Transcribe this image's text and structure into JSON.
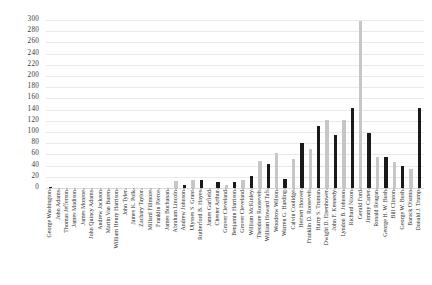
{
  "chart_data": {
    "type": "bar",
    "title": "",
    "xlabel": "",
    "ylabel": "",
    "ylim": [
      0,
      300
    ],
    "ytick_step": 20,
    "grid": true,
    "legend": "none",
    "colors": {
      "dark": "#1a1a1a",
      "light": "#c6c6c6"
    },
    "yticks": [
      "300",
      "280",
      "260",
      "240",
      "220",
      "200",
      "180",
      "160",
      "140",
      "120",
      "100",
      "80",
      "60",
      "40",
      "20",
      "0"
    ],
    "categories": [
      "George Washington",
      "John Adams",
      "Thomas Jefferson",
      "James Madison",
      "James Monroe",
      "John Quincy Adams",
      "Andrew Jackson",
      "Martin Van Buren",
      "William Henry Harrison",
      "John Tyler",
      "James K. Polk",
      "Zachary Taylor",
      "Millard Fillmore",
      "Franklin Pierce",
      "James Buchanan",
      "Abraham Lincoln",
      "Andrew Johnson",
      "Ulysses S. Grant",
      "Rutherford B. Hayes",
      "James Garfield",
      "Chester Arthur",
      "Grover Cleveland",
      "Benjamin Harrison",
      "Grover Cleveland",
      "William McKinley",
      "Theodore Roosevelt",
      "William Howard Taft",
      "Woodrow Wilson",
      "Warren G. Harding",
      "Calvin Coolidge",
      "Herbert Hoover",
      "Franklin D. Roosevelt",
      "Harry S. Truman",
      "Dwight D. Eisenhower",
      "John F. Kennedy",
      "Lyndon B. Johnson",
      "Richard Nixon",
      "Gerald Ford",
      "Jimmy Carter",
      "Ronald Reagan",
      "George H. W. Bush",
      "Bill Clinton",
      "George W. Bush",
      "Barack Obama",
      "Donald J. Trump"
    ],
    "values": [
      1,
      0,
      0,
      0,
      0,
      0,
      0,
      0,
      0,
      0,
      0,
      0,
      0,
      0,
      0,
      12,
      6,
      14,
      14,
      0,
      10,
      6,
      10,
      14,
      22,
      48,
      42,
      62,
      16,
      52,
      80,
      70,
      110,
      122,
      94,
      122,
      142,
      298,
      98,
      56,
      56,
      46,
      40,
      34,
      142
    ],
    "series_colors": [
      "dark",
      "light",
      "dark",
      "light",
      "dark",
      "light",
      "dark",
      "light",
      "dark",
      "light",
      "dark",
      "light",
      "dark",
      "light",
      "dark",
      "light",
      "dark",
      "light",
      "dark",
      "light",
      "dark",
      "light",
      "dark",
      "light",
      "dark",
      "light",
      "dark",
      "light",
      "dark",
      "light",
      "dark",
      "light",
      "dark",
      "light",
      "dark",
      "light",
      "dark",
      "light",
      "dark",
      "light",
      "dark",
      "light",
      "dark",
      "light",
      "dark"
    ]
  }
}
